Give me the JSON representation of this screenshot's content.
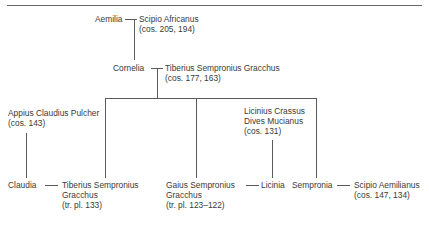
{
  "diagram": {
    "type": "family-tree",
    "nodes": {
      "aemilia": {
        "name": "Aemilia"
      },
      "scipio_africanus": {
        "name": "Scipio Africanus",
        "note": "(cos. 205, 194)"
      },
      "cornelia": {
        "name": "Cornelia"
      },
      "tiberius_elder": {
        "name": "Tiberius Sempronius Gracchus",
        "note": "(cos. 177, 163)"
      },
      "appius": {
        "name": "Appius Claudius Pulcher",
        "note": "(cos. 143)"
      },
      "licinius": {
        "name_line1": "Licinius Crassus",
        "name_line2": "Dives Mucianus",
        "note": "(cos. 131)"
      },
      "claudia": {
        "name": "Claudia"
      },
      "tiberius": {
        "name_line1": "Tiberius Sempronius",
        "name_line2": "Gracchus",
        "note": "(tr. pl. 133)"
      },
      "gaius": {
        "name_line1": "Gaius Sempronius",
        "name_line2": "Gracchus",
        "note": "(tr. pl. 123–122)"
      },
      "licinia": {
        "name": "Licinia"
      },
      "sempronia": {
        "name": "Sempronia"
      },
      "scipio_aemilianus": {
        "name": "Scipio Aemilianus",
        "note": "(cos. 147, 134)"
      }
    },
    "marriages": [
      [
        "Aemilia",
        "Scipio Africanus"
      ],
      [
        "Cornelia",
        "Tiberius Sempronius Gracchus"
      ],
      [
        "Claudia",
        "Tiberius Sempronius Gracchus (tr. pl. 133)"
      ],
      [
        "Gaius Sempronius Gracchus",
        "Licinia"
      ],
      [
        "Sempronia",
        "Scipio Aemilianus"
      ]
    ],
    "children": {
      "Aemilia + Scipio Africanus": [
        "Cornelia"
      ],
      "Cornelia + Tiberius Sempronius Gracchus": [
        "Tiberius Sempronius Gracchus",
        "Gaius Sempronius Gracchus",
        "Sempronia"
      ],
      "Appius Claudius Pulcher": [
        "Claudia"
      ],
      "Licinius Crassus Dives Mucianus": [
        "Licinia"
      ]
    }
  }
}
